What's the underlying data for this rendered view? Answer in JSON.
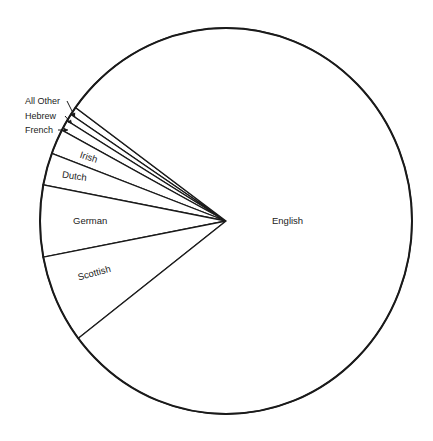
{
  "chart_data": {
    "type": "pie",
    "title": "",
    "start_angle_deg": 144,
    "direction": "counterclockwise",
    "legend": "none",
    "slices": [
      {
        "label": "All Other",
        "value": 0.7,
        "label_mode": "callout"
      },
      {
        "label": "Hebrew",
        "value": 0.6,
        "label_mode": "callout"
      },
      {
        "label": "French",
        "value": 0.9,
        "label_mode": "callout"
      },
      {
        "label": "Irish",
        "value": 2.1,
        "label_mode": "inside"
      },
      {
        "label": "Dutch",
        "value": 2.7,
        "label_mode": "inside"
      },
      {
        "label": "German",
        "value": 6.0,
        "label_mode": "inside"
      },
      {
        "label": "Scottish",
        "value": 7.4,
        "label_mode": "inside"
      },
      {
        "label": "English",
        "value": 79.6,
        "label_mode": "inside"
      }
    ],
    "colors": {
      "fill": "#ffffff",
      "stroke": "#1a1a1a",
      "text": "#222222"
    }
  }
}
